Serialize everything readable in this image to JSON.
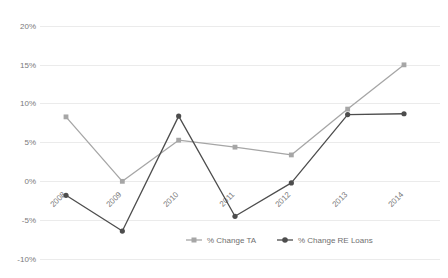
{
  "chart_data": {
    "type": "line",
    "title": "",
    "xlabel": "",
    "ylabel": "",
    "categories": [
      "2008",
      "2009",
      "2010",
      "2011",
      "2012",
      "2013",
      "2014"
    ],
    "ylim": [
      -10,
      20
    ],
    "yticks": [
      20,
      15,
      10,
      5,
      0,
      -5,
      -10
    ],
    "ytick_labels": [
      "20%",
      "15%",
      "10%",
      "5%",
      "0%",
      "-5%",
      "-10%"
    ],
    "grid": true,
    "legend_position": "bottom",
    "series": [
      {
        "name": "% Change TA",
        "color": "#a6a6a6",
        "marker": "square",
        "values": [
          8.3,
          0.0,
          5.3,
          4.4,
          3.4,
          9.3,
          15.0
        ]
      },
      {
        "name": "% Change RE Loans",
        "color": "#4d4d4d",
        "marker": "circle",
        "values": [
          -1.8,
          -6.4,
          8.4,
          -4.5,
          -0.2,
          8.6,
          8.7
        ]
      }
    ]
  },
  "axis": {
    "y_tick_labels": [
      "20%",
      "15%",
      "10%",
      "5%",
      "0%",
      "-5%",
      "-10%"
    ],
    "x_tick_labels": [
      "2008",
      "2009",
      "2010",
      "2011",
      "2012",
      "2013",
      "2014"
    ]
  },
  "legend": {
    "items": [
      {
        "label": "% Change TA"
      },
      {
        "label": "% Change RE Loans"
      }
    ]
  },
  "colors": {
    "series_ta": "#a6a6a6",
    "series_re": "#4d4d4d",
    "gridline": "#ebebeb",
    "text": "#7a7a7a",
    "background": "#ffffff"
  }
}
